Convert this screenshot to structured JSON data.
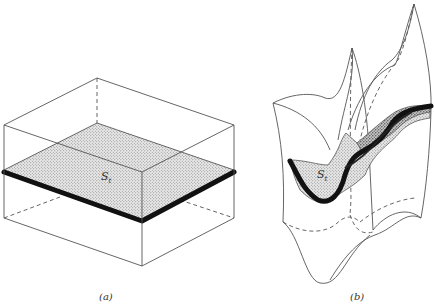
{
  "figure": {
    "panel_a": {
      "caption": "(a)",
      "surface_label": "S",
      "surface_label_subscript": "t"
    },
    "panel_b": {
      "caption": "(b)",
      "surface_label": "S",
      "surface_label_subscript": "t"
    }
  },
  "colors": {
    "stroke": "#555555",
    "thick_edge": "#111111",
    "fill_stipple": "#cfcfcf"
  }
}
